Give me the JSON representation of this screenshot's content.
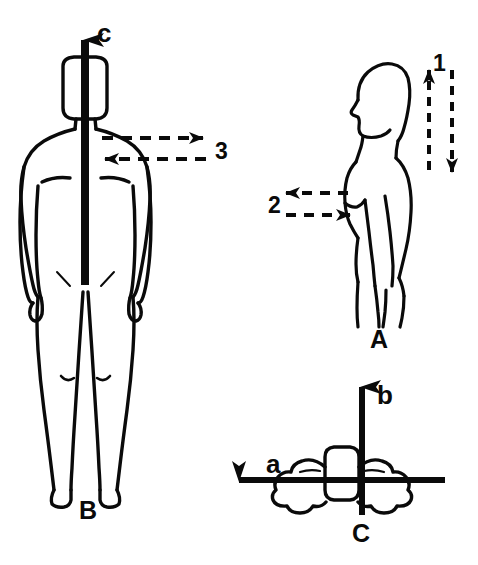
{
  "diagram": {
    "background_color": "#ffffff",
    "ink_color": "#0a0a0a",
    "panels": [
      {
        "id": "A",
        "label": "A",
        "view": "lateral-sagittal-side-view",
        "label_x": 370,
        "label_y": 327
      },
      {
        "id": "B",
        "label": "B",
        "view": "anterior-frontal-view",
        "label_x": 79,
        "label_y": 498
      },
      {
        "id": "C",
        "label": "C",
        "view": "superior-transverse-top-view",
        "label_x": 352,
        "label_y": 521
      }
    ],
    "axis_labels": [
      {
        "name": "axis-c",
        "text": "c",
        "panel": "B",
        "direction": "up",
        "x": 97,
        "y": 20
      },
      {
        "name": "axis-b",
        "text": "b",
        "panel": "C",
        "direction": "up",
        "x": 377,
        "y": 382
      },
      {
        "name": "axis-a",
        "text": "a",
        "panel": "C",
        "direction": "left",
        "x": 266,
        "y": 451
      }
    ],
    "motion_markers": [
      {
        "name": "marker-1",
        "text": "1",
        "panel": "A",
        "style": "dashed-double-arrow-vertical",
        "directions": [
          "up",
          "down"
        ],
        "x": 433,
        "y": 52
      },
      {
        "name": "marker-2",
        "text": "2",
        "panel": "A",
        "style": "dashed-double-arrow-horizontal",
        "directions": [
          "left",
          "right"
        ],
        "x": 268,
        "y": 194
      },
      {
        "name": "marker-3",
        "text": "3",
        "panel": "B",
        "style": "dashed-double-arrow-horizontal",
        "directions": [
          "right",
          "left"
        ],
        "x": 215,
        "y": 140
      }
    ]
  }
}
